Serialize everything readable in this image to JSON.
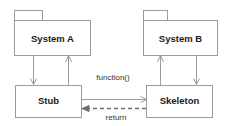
{
  "diagram": {
    "canvas": {
      "width": 228,
      "height": 126,
      "background": "#ffffff"
    },
    "style": {
      "stroke": "#9b9b9b",
      "dashed_stroke": "#6f6f6f",
      "fill": "#ffffff",
      "label_color": "#1a1a1a",
      "edge_label_color": "#333333"
    },
    "nodes": [
      {
        "id": "system-a",
        "label": "System A",
        "shape": "uml-package",
        "x": 14,
        "y": 20,
        "width": 76,
        "height": 35,
        "tab": {
          "x": 14,
          "y": 10,
          "width": 28,
          "height": 10
        }
      },
      {
        "id": "system-b",
        "label": "System B",
        "shape": "uml-package",
        "x": 143,
        "y": 20,
        "width": 75,
        "height": 35,
        "tab": {
          "x": 143,
          "y": 10,
          "width": 24,
          "height": 10
        }
      },
      {
        "id": "stub",
        "label": "Stub",
        "shape": "rectangle",
        "x": 15,
        "y": 85,
        "width": 66,
        "height": 33
      },
      {
        "id": "skeleton",
        "label": "Skeleton",
        "shape": "rectangle",
        "x": 146,
        "y": 85,
        "width": 66,
        "height": 33
      }
    ],
    "edges": [
      {
        "id": "system-a-to-stub",
        "from": "system-a",
        "to": "stub",
        "label": "",
        "style": "solid",
        "arrowhead": "open",
        "direction": "down"
      },
      {
        "id": "stub-to-system-a",
        "from": "stub",
        "to": "system-a",
        "label": "",
        "style": "solid",
        "arrowhead": "open",
        "direction": "up"
      },
      {
        "id": "skeleton-to-system-b",
        "from": "skeleton",
        "to": "system-b",
        "label": "",
        "style": "solid",
        "arrowhead": "open",
        "direction": "up"
      },
      {
        "id": "system-b-to-skeleton",
        "from": "system-b",
        "to": "skeleton",
        "label": "",
        "style": "solid",
        "arrowhead": "open",
        "direction": "down"
      },
      {
        "id": "stub-to-skeleton",
        "from": "stub",
        "to": "skeleton",
        "label": "function()",
        "style": "solid",
        "arrowhead": "open",
        "direction": "right"
      },
      {
        "id": "skeleton-to-stub",
        "from": "skeleton",
        "to": "stub",
        "label": "return",
        "style": "dashed",
        "arrowhead": "solid",
        "direction": "left"
      }
    ],
    "labels": {
      "system_a": "System A",
      "system_b": "System B",
      "stub": "Stub",
      "skeleton": "Skeleton",
      "function_call": "function()",
      "return_value": "return"
    }
  }
}
